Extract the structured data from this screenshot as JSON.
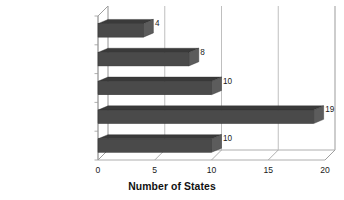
{
  "chart_data": {
    "type": "bar",
    "orientation": "horizontal",
    "title": "",
    "xlabel": "Number of States",
    "ylabel": "",
    "categories": [
      "$100K to $250K",
      "$250K to $500K",
      "$500K to $1 million",
      "$1 million or more",
      "Not Reported"
    ],
    "values": [
      4,
      8,
      10,
      19,
      10
    ],
    "data_labels": [
      "4",
      "8",
      "10",
      "19",
      "10"
    ],
    "xlim": [
      0,
      20
    ],
    "xticks": [
      0,
      5,
      10,
      15,
      20
    ],
    "xtick_labels": [
      "0",
      "5",
      "10",
      "15",
      "20"
    ],
    "grid": true,
    "grid_axis": "x",
    "legend": false,
    "style": "3d",
    "bar_color": "#4a4a4a",
    "bar_top_color": "#3a3a3a",
    "bar_side_color": "#5c5c5c",
    "axis_color": "#9a9a9a",
    "grid_color": "#b8b8b8",
    "background_color": "#ffffff",
    "text_color": "#1a1a1a"
  }
}
